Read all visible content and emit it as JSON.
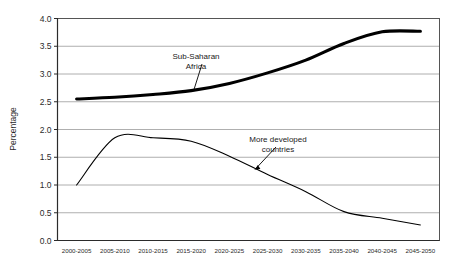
{
  "chart_data": {
    "type": "line",
    "title": "",
    "xlabel": "",
    "ylabel": "Percentage",
    "ylim": [
      0.0,
      4.0
    ],
    "ytick_step": 0.5,
    "grid": true,
    "legend_position": "inline-annotations",
    "categories": [
      "2000-2005",
      "2005-2010",
      "2010-2015",
      "2015-2020",
      "2020-2025",
      "2025-2030",
      "2030-2035",
      "2035-2040",
      "2040-2045",
      "2045-2050"
    ],
    "ytick_labels": [
      "0.0",
      "0.5",
      "1.0",
      "1.5",
      "2.0",
      "2.5",
      "3.0",
      "3.5",
      "4.0"
    ],
    "series": [
      {
        "name": "Sub-Saharan Africa",
        "style": "thick",
        "color": "#000000",
        "values": [
          2.55,
          2.58,
          2.63,
          2.7,
          2.83,
          3.02,
          3.25,
          3.55,
          3.76,
          3.77
        ]
      },
      {
        "name": "More developed countries",
        "style": "thin",
        "color": "#000000",
        "values": [
          1.0,
          1.85,
          1.85,
          1.79,
          1.52,
          1.19,
          0.88,
          0.52,
          0.4,
          0.28
        ]
      }
    ],
    "annotations": [
      {
        "id": "sub-saharan-africa",
        "lines": [
          "Sub-Saharan",
          "Africa"
        ],
        "points_to_series": "Sub-Saharan Africa",
        "points_to_value": 2.72
      },
      {
        "id": "more-developed-countries",
        "lines": [
          "More developed",
          "countries"
        ],
        "points_to_series": "More developed countries",
        "points_to_value": 1.28
      }
    ]
  },
  "colors": {
    "background": "#ffffff",
    "gridline": "#9a9a9a",
    "frame": "#555555",
    "series": "#000000",
    "text": "#2b2b2b"
  }
}
